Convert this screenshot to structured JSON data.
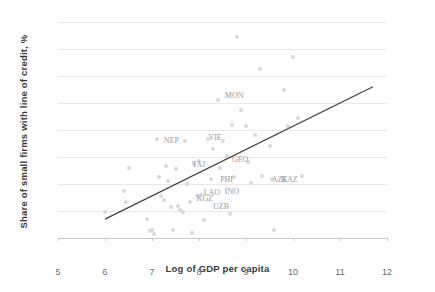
{
  "chart_data": {
    "type": "scatter",
    "title": "",
    "xlabel": "Log of GDP per capita",
    "ylabel": "Share of small firms with line of credit, %",
    "xlim": [
      5,
      12
    ],
    "ylim": [
      0,
      80
    ],
    "xticks": [
      "5",
      "6",
      "7",
      "8",
      "9",
      "10",
      "11",
      "12"
    ],
    "yticks": [
      "0",
      "10",
      "20",
      "30",
      "40",
      "50",
      "60",
      "70",
      "80"
    ],
    "grid": true,
    "legend": "none",
    "point_color": "#d9d9d9",
    "trendline_color": "#404040",
    "trendline": {
      "x0": 6.0,
      "y0": 7.0,
      "x1": 11.7,
      "y1": 56.0
    },
    "points": [
      {
        "x": 6.0,
        "y": 9.5
      },
      {
        "x": 6.4,
        "y": 17.5
      },
      {
        "x": 6.45,
        "y": 13.5
      },
      {
        "x": 6.5,
        "y": 26.0
      },
      {
        "x": 6.9,
        "y": 7.0
      },
      {
        "x": 6.95,
        "y": 2.5
      },
      {
        "x": 7.0,
        "y": 3.0
      },
      {
        "x": 7.05,
        "y": 1.5
      },
      {
        "x": 7.1,
        "y": 36.5
      },
      {
        "x": 7.15,
        "y": 22.5
      },
      {
        "x": 7.2,
        "y": 15.5
      },
      {
        "x": 7.25,
        "y": 14.0
      },
      {
        "x": 7.3,
        "y": 26.5
      },
      {
        "x": 7.35,
        "y": 21.0
      },
      {
        "x": 7.4,
        "y": 11.5
      },
      {
        "x": 7.45,
        "y": 3.0
      },
      {
        "x": 7.5,
        "y": 25.5
      },
      {
        "x": 7.55,
        "y": 12.0
      },
      {
        "x": 7.6,
        "y": 10.5
      },
      {
        "x": 7.65,
        "y": 9.5
      },
      {
        "x": 7.7,
        "y": 36.0
      },
      {
        "x": 7.75,
        "y": 20.0
      },
      {
        "x": 7.8,
        "y": 13.5
      },
      {
        "x": 7.85,
        "y": 2.0
      },
      {
        "x": 7.9,
        "y": 27.5
      },
      {
        "x": 7.95,
        "y": 15.5
      },
      {
        "x": 8.0,
        "y": 28.5
      },
      {
        "x": 8.05,
        "y": 16.0
      },
      {
        "x": 8.1,
        "y": 6.5
      },
      {
        "x": 8.2,
        "y": 36.5
      },
      {
        "x": 8.25,
        "y": 22.0
      },
      {
        "x": 8.3,
        "y": 33.0
      },
      {
        "x": 8.4,
        "y": 51.0
      },
      {
        "x": 8.45,
        "y": 26.0
      },
      {
        "x": 8.5,
        "y": 36.0
      },
      {
        "x": 8.6,
        "y": 30.5
      },
      {
        "x": 8.65,
        "y": 9.0
      },
      {
        "x": 8.7,
        "y": 42.0
      },
      {
        "x": 8.75,
        "y": 22.5
      },
      {
        "x": 8.8,
        "y": 74.5
      },
      {
        "x": 8.9,
        "y": 47.5
      },
      {
        "x": 9.0,
        "y": 41.5
      },
      {
        "x": 9.05,
        "y": 28.0
      },
      {
        "x": 9.1,
        "y": 20.5
      },
      {
        "x": 9.2,
        "y": 38.0
      },
      {
        "x": 9.3,
        "y": 62.5
      },
      {
        "x": 9.35,
        "y": 23.0
      },
      {
        "x": 9.5,
        "y": 34.0
      },
      {
        "x": 9.55,
        "y": 22.0
      },
      {
        "x": 9.6,
        "y": 3.0
      },
      {
        "x": 9.8,
        "y": 55.0
      },
      {
        "x": 9.9,
        "y": 41.5
      },
      {
        "x": 10.0,
        "y": 67.0
      },
      {
        "x": 10.1,
        "y": 44.5
      },
      {
        "x": 10.2,
        "y": 23.0
      }
    ],
    "annotations": [
      {
        "text": "MON",
        "x": 8.55,
        "y": 52.5
      },
      {
        "text": "NEP",
        "x": 7.25,
        "y": 36.0
      },
      {
        "text": "VIE",
        "x": 8.2,
        "y": 37.0
      },
      {
        "text": "TAJ",
        "x": 7.85,
        "y": 27.0
      },
      {
        "text": "GEO",
        "x": 8.7,
        "y": 29.0
      },
      {
        "text": "PHI",
        "x": 8.45,
        "y": 21.5
      },
      {
        "text": "INO",
        "x": 8.55,
        "y": 17.0
      },
      {
        "text": "LAO",
        "x": 8.1,
        "y": 16.5
      },
      {
        "text": "KGZ",
        "x": 7.95,
        "y": 14.5
      },
      {
        "text": "UZB",
        "x": 8.3,
        "y": 11.5
      },
      {
        "text": "AZE",
        "x": 9.55,
        "y": 21.5
      },
      {
        "text": "KAZ",
        "x": 9.75,
        "y": 21.5
      }
    ]
  }
}
